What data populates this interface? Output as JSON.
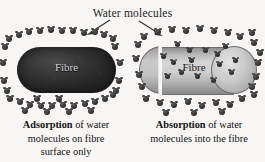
{
  "figure": {
    "title": "Water molecules",
    "background_color": "#f7f6f4",
    "molecule_color": "#262626"
  },
  "annotations": {
    "arrow_left_name": "arrow-to-adsorption",
    "arrow_right_name": "arrow-to-absorption"
  },
  "panels": [
    {
      "id": "adsorption",
      "fibre_label": "Fibre",
      "fibre_color": "#262626",
      "caption_bold": "Adsorption",
      "caption_rest": " of water molecules on fibre surface only",
      "caption_line1_bold": "Adsorption",
      "caption_line1_rest": " of water",
      "caption_line2": "molecules on fibre",
      "caption_line3": "surface only",
      "molecules_outside": 36,
      "molecules_inside": 0
    },
    {
      "id": "absorption",
      "fibre_label": "Fibre",
      "fibre_color": "#c6c6c6",
      "caption_bold": "Absorption",
      "caption_rest": " of water molecules into the fibre",
      "caption_line1_bold": "Absorption",
      "caption_line1_rest": " of water",
      "caption_line2": "molecules into the fibre",
      "caption_line3": "",
      "molecules_outside": 30,
      "molecules_inside": 15
    }
  ],
  "molecule_positions": {
    "adsorption_outside": [
      [
        6,
        10
      ],
      [
        16,
        6
      ],
      [
        26,
        3
      ],
      [
        37,
        2
      ],
      [
        48,
        1
      ],
      [
        59,
        2
      ],
      [
        70,
        2
      ],
      [
        81,
        4
      ],
      [
        92,
        3
      ],
      [
        101,
        6
      ],
      [
        110,
        10
      ],
      [
        2,
        18
      ],
      [
        112,
        18
      ],
      [
        0,
        34
      ],
      [
        117,
        34
      ],
      [
        1,
        52
      ],
      [
        116,
        52
      ],
      [
        4,
        62
      ],
      [
        113,
        62
      ],
      [
        7,
        70
      ],
      [
        17,
        73
      ],
      [
        27,
        76
      ],
      [
        38,
        77
      ],
      [
        49,
        77
      ],
      [
        60,
        76
      ],
      [
        71,
        77
      ],
      [
        82,
        75
      ],
      [
        92,
        73
      ],
      [
        102,
        70
      ],
      [
        110,
        66
      ],
      [
        22,
        82
      ],
      [
        44,
        83
      ],
      [
        66,
        83
      ],
      [
        88,
        82
      ],
      [
        34,
        70
      ],
      [
        56,
        70
      ]
    ],
    "adsorption_inside": [],
    "absorption_outside": [
      [
        8,
        8
      ],
      [
        22,
        3
      ],
      [
        36,
        1
      ],
      [
        50,
        2
      ],
      [
        64,
        0
      ],
      [
        78,
        2
      ],
      [
        92,
        4
      ],
      [
        104,
        8
      ],
      [
        116,
        4
      ],
      [
        2,
        16
      ],
      [
        118,
        14
      ],
      [
        124,
        24
      ],
      [
        0,
        30
      ],
      [
        122,
        34
      ],
      [
        3,
        46
      ],
      [
        120,
        48
      ],
      [
        6,
        58
      ],
      [
        116,
        58
      ],
      [
        10,
        70
      ],
      [
        24,
        74
      ],
      [
        38,
        76
      ],
      [
        52,
        73
      ],
      [
        66,
        77
      ],
      [
        80,
        74
      ],
      [
        94,
        76
      ],
      [
        106,
        70
      ],
      [
        118,
        66
      ],
      [
        30,
        84
      ],
      [
        58,
        84
      ],
      [
        86,
        83
      ]
    ],
    "absorption_inside": [
      [
        28,
        28
      ],
      [
        42,
        16
      ],
      [
        56,
        32
      ],
      [
        70,
        22
      ],
      [
        84,
        36
      ],
      [
        46,
        44
      ],
      [
        62,
        48
      ],
      [
        32,
        48
      ],
      [
        78,
        52
      ],
      [
        90,
        18
      ],
      [
        96,
        44
      ],
      [
        82,
        26
      ],
      [
        100,
        32
      ],
      [
        38,
        34
      ],
      [
        54,
        22
      ]
    ]
  }
}
